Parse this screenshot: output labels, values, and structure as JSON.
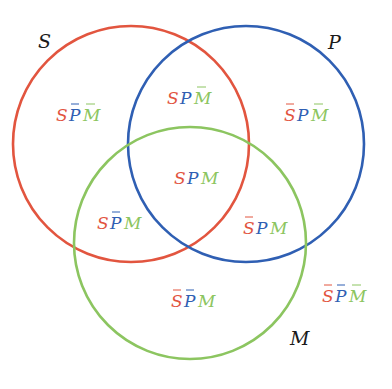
{
  "diagram": {
    "type": "venn-3",
    "colors": {
      "S": "#e2553f",
      "P": "#2f5fb3",
      "M": "#8cc560",
      "label": "#1a1a1a"
    },
    "circles": [
      {
        "id": "S",
        "label": "S",
        "cx": 131,
        "cy": 144,
        "r": 118,
        "color": "#e2553f"
      },
      {
        "id": "P",
        "label": "P",
        "cx": 246,
        "cy": 144,
        "r": 118,
        "color": "#2f5fb3"
      },
      {
        "id": "M",
        "label": "M",
        "cx": 190,
        "cy": 243,
        "r": 116,
        "color": "#8cc560"
      }
    ],
    "set_labels": {
      "S": "S",
      "P": "P",
      "M": "M"
    },
    "regions": [
      {
        "id": "S-notP-notM",
        "text": "SP̄M̄",
        "letters": [
          {
            "ch": "S",
            "bar": false
          },
          {
            "ch": "P",
            "bar": true
          },
          {
            "ch": "M",
            "bar": true
          }
        ]
      },
      {
        "id": "S-P-notM",
        "text": "SPM̄",
        "letters": [
          {
            "ch": "S",
            "bar": false
          },
          {
            "ch": "P",
            "bar": false
          },
          {
            "ch": "M",
            "bar": true
          }
        ]
      },
      {
        "id": "notS-P-notM",
        "text": "S̄PM̄",
        "letters": [
          {
            "ch": "S",
            "bar": true
          },
          {
            "ch": "P",
            "bar": false
          },
          {
            "ch": "M",
            "bar": true
          }
        ]
      },
      {
        "id": "S-P-M",
        "text": "SPM",
        "letters": [
          {
            "ch": "S",
            "bar": false
          },
          {
            "ch": "P",
            "bar": false
          },
          {
            "ch": "M",
            "bar": false
          }
        ]
      },
      {
        "id": "S-notP-M",
        "text": "SP̄M",
        "letters": [
          {
            "ch": "S",
            "bar": false
          },
          {
            "ch": "P",
            "bar": true
          },
          {
            "ch": "M",
            "bar": false
          }
        ]
      },
      {
        "id": "notS-P-M",
        "text": "S̄PM",
        "letters": [
          {
            "ch": "S",
            "bar": true
          },
          {
            "ch": "P",
            "bar": false
          },
          {
            "ch": "M",
            "bar": false
          }
        ]
      },
      {
        "id": "notS-notP-M",
        "text": "S̄P̄M",
        "letters": [
          {
            "ch": "S",
            "bar": true
          },
          {
            "ch": "P",
            "bar": true
          },
          {
            "ch": "M",
            "bar": false
          }
        ]
      },
      {
        "id": "notS-notP-notM",
        "text": "S̄P̄M̄",
        "letters": [
          {
            "ch": "S",
            "bar": true
          },
          {
            "ch": "P",
            "bar": true
          },
          {
            "ch": "M",
            "bar": true
          }
        ]
      }
    ]
  }
}
